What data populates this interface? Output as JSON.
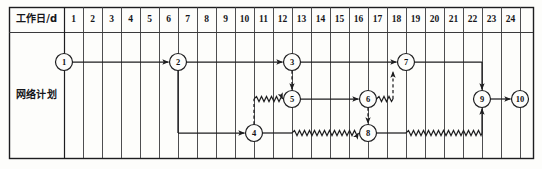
{
  "figure": {
    "kind": "network-schedule-gantt",
    "width": 542,
    "height": 169,
    "background_color": "#fdfdfb",
    "line_color": "#1d1d1f",
    "grid_color": "#3a3a3c"
  },
  "table": {
    "header_label": "工作日/d",
    "row_label": "网络计划",
    "day_columns": [
      "1",
      "2",
      "3",
      "4",
      "5",
      "6",
      "7",
      "8",
      "9",
      "10",
      "11",
      "12",
      "13",
      "14",
      "15",
      "16",
      "17",
      "18",
      "19",
      "20",
      "21",
      "22",
      "23",
      "24"
    ],
    "column_count": 24,
    "has_trailing_blank_column": true,
    "geometry": {
      "frame_left": 9,
      "frame_right": 533,
      "frame_top": 7,
      "frame_bottom": 158,
      "header_bottom": 32,
      "label_col_right": 64,
      "day_col_width": 19.0
    }
  },
  "lanes": {
    "top_y": 62,
    "middle_y": 99,
    "bottom_y": 133
  },
  "nodes": [
    {
      "id": "1",
      "label": "1",
      "day": 0,
      "lane": "top",
      "cx": 64,
      "cy": 62,
      "r": 8.5
    },
    {
      "id": "2",
      "label": "2",
      "day": 6,
      "lane": "top",
      "cx": 178,
      "cy": 62,
      "r": 8.5
    },
    {
      "id": "3",
      "label": "3",
      "day": 12,
      "lane": "top",
      "cx": 292,
      "cy": 62,
      "r": 8.5
    },
    {
      "id": "7",
      "label": "7",
      "day": 18,
      "lane": "top",
      "cx": 406,
      "cy": 62,
      "r": 8.5
    },
    {
      "id": "5",
      "label": "5",
      "day": 12,
      "lane": "middle",
      "cx": 292,
      "cy": 99,
      "r": 8.5
    },
    {
      "id": "6",
      "label": "6",
      "day": 16,
      "lane": "middle",
      "cx": 368,
      "cy": 99,
      "r": 8.5
    },
    {
      "id": "9",
      "label": "9",
      "day": 22,
      "lane": "middle",
      "cx": 482,
      "cy": 99,
      "r": 8.5
    },
    {
      "id": "10",
      "label": "10",
      "day": 24,
      "lane": "middle",
      "cx": 520,
      "cy": 99,
      "r": 8.5
    },
    {
      "id": "4",
      "label": "4",
      "day": 10,
      "lane": "bottom",
      "cx": 254,
      "cy": 133,
      "r": 8.5
    },
    {
      "id": "8",
      "label": "8",
      "day": 16,
      "lane": "bottom",
      "cx": 368,
      "cy": 133,
      "r": 8.5
    }
  ],
  "arrows": [
    {
      "name": "arrow-1-to-2",
      "from": "1",
      "to": "2",
      "style": "solid",
      "path": "h"
    },
    {
      "name": "arrow-2-to-3",
      "from": "2",
      "to": "3",
      "style": "solid",
      "path": "h"
    },
    {
      "name": "arrow-3-to-7",
      "from": "3",
      "to": "7",
      "style": "solid",
      "path": "h"
    },
    {
      "name": "arrow-2-to-4",
      "from": "2",
      "to": "4",
      "style": "solid",
      "path": "down-then-right"
    },
    {
      "name": "arrow-3-to-5",
      "from": "3",
      "to": "5",
      "style": "dashed",
      "path": "v"
    },
    {
      "name": "arrow-4-to-5",
      "from": "4",
      "to": "5",
      "style": "dashed-then-wave",
      "path": "up-then-right"
    },
    {
      "name": "arrow-5-to-6",
      "from": "5",
      "to": "6",
      "style": "solid",
      "path": "h"
    },
    {
      "name": "arrow-6-to-8",
      "from": "6",
      "to": "8",
      "style": "dashed",
      "path": "v"
    },
    {
      "name": "arrow-6-to-7",
      "from": "6",
      "to": "7",
      "style": "wave-then-dashed",
      "path": "right-then-up"
    },
    {
      "name": "arrow-4-to-8",
      "from": "4",
      "to": "8",
      "style": "solid-then-wave",
      "path": "h"
    },
    {
      "name": "arrow-8-to-9",
      "from": "8",
      "to": "9",
      "style": "solid-then-wave",
      "path": "right-then-up"
    },
    {
      "name": "arrow-7-to-9",
      "from": "7",
      "to": "9",
      "style": "solid",
      "path": "right-then-down"
    },
    {
      "name": "arrow-9-to-10",
      "from": "9",
      "to": "10",
      "style": "solid",
      "path": "h"
    }
  ],
  "legend_semantics": {
    "solid_line": "工作（实线为实际作业）",
    "wave_line": "自由时差（波形线）",
    "dashed_line": "虚工作（虚箭线）"
  }
}
